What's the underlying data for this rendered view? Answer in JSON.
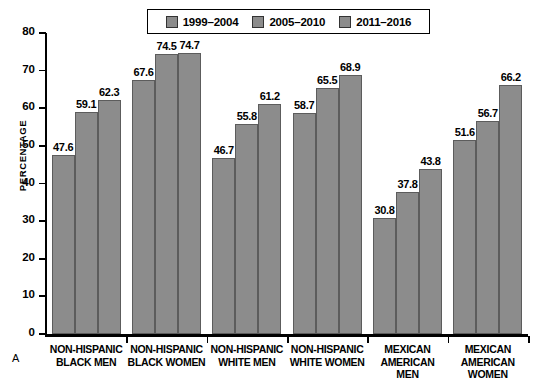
{
  "panel": {
    "letter": "A"
  },
  "legend": {
    "position": "top-center",
    "items": [
      {
        "label": "1999–2004",
        "color": "#8c8c8c",
        "icon": "legend-swatch"
      },
      {
        "label": "2005–2010",
        "color": "#8c8c8c",
        "icon": "legend-swatch"
      },
      {
        "label": "2011–2016",
        "color": "#8c8c8c",
        "icon": "legend-swatch"
      }
    ]
  },
  "axes": {
    "ylabel": "PERCENTAGE",
    "yticks": [
      "0",
      "10",
      "20",
      "30",
      "40",
      "50",
      "60",
      "70",
      "80"
    ]
  },
  "chart_data": {
    "type": "bar",
    "title": "",
    "xlabel": "",
    "ylabel": "PERCENTAGE",
    "ylim": [
      0,
      80
    ],
    "ytick_step": 10,
    "grid": false,
    "legend_position": "top-center",
    "categories": [
      "NON-HISPANIC BLACK MEN",
      "NON-HISPANIC BLACK WOMEN",
      "NON-HISPANIC WHITE MEN",
      "NON-HISPANIC WHITE WOMEN",
      "MEXICAN AMERICAN MEN",
      "MEXICAN AMERICAN WOMEN"
    ],
    "category_lines": [
      [
        "NON-HISPANIC",
        "BLACK MEN"
      ],
      [
        "NON-HISPANIC",
        "BLACK WOMEN"
      ],
      [
        "NON-HISPANIC",
        "WHITE MEN"
      ],
      [
        "NON-HISPANIC",
        "WHITE WOMEN"
      ],
      [
        "MEXICAN",
        "AMERICAN",
        "MEN"
      ],
      [
        "MEXICAN",
        "AMERICAN",
        "WOMEN"
      ]
    ],
    "series": [
      {
        "name": "1999–2004",
        "color": "#8c8c8c",
        "values": [
          47.6,
          67.6,
          46.7,
          58.7,
          30.8,
          51.6
        ]
      },
      {
        "name": "2005–2010",
        "color": "#8c8c8c",
        "values": [
          59.1,
          74.5,
          55.8,
          65.5,
          37.8,
          56.7
        ]
      },
      {
        "name": "2011–2016",
        "color": "#8c8c8c",
        "values": [
          62.3,
          74.7,
          61.2,
          68.9,
          43.8,
          66.2
        ]
      }
    ],
    "data_labels": [
      [
        "47.6",
        "59.1",
        "62.3"
      ],
      [
        "67.6",
        "74.5",
        "74.7"
      ],
      [
        "46.7",
        "55.8",
        "61.2"
      ],
      [
        "58.7",
        "65.5",
        "68.9"
      ],
      [
        "30.8",
        "37.8",
        "43.8"
      ],
      [
        "51.6",
        "56.7",
        "66.2"
      ]
    ]
  }
}
